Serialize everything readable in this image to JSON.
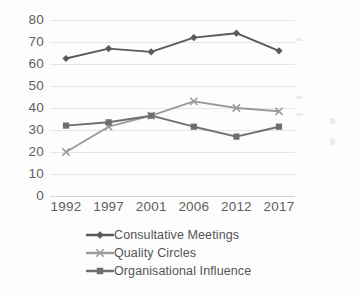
{
  "chart_data": {
    "type": "line",
    "title": "",
    "subtitle": "",
    "xlabel": "",
    "ylabel": "",
    "categories": [
      "1992",
      "1997",
      "2001",
      "2006",
      "2012",
      "2017"
    ],
    "ylim": [
      0,
      80
    ],
    "ytick_step": 10,
    "yticks": [
      "80",
      "70",
      "60",
      "50",
      "40",
      "30",
      "20",
      "10",
      "0"
    ],
    "grid": "horizontal",
    "legend_position": "bottom-left",
    "series": [
      {
        "name": "Consultative Meetings",
        "values": [
          62.5,
          67,
          65.5,
          72,
          74,
          66
        ],
        "color": "#5a5a5a",
        "marker": "diamond"
      },
      {
        "name": "Quality Circles",
        "values": [
          20,
          31.5,
          36.5,
          43,
          40,
          38.5
        ],
        "color": "#9a9a9a",
        "marker": "x"
      },
      {
        "name": "Organisational Influence",
        "values": [
          32,
          33.5,
          36.5,
          31.5,
          27,
          31.5
        ],
        "color": "#6e6e6e",
        "marker": "square"
      }
    ]
  },
  "colors": {
    "gridline": "#e6e6e6",
    "tick_text": "#5f5f5f",
    "legend_text": "#545454",
    "background": "#fdfdfd"
  }
}
